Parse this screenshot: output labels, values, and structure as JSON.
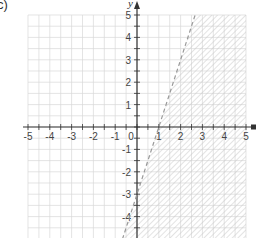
{
  "figure_label": "c)",
  "chart_data": {
    "type": "line",
    "title": "",
    "subtitle": "Graph of linear inequality",
    "xlabel": "x",
    "ylabel": "y",
    "xlim": [
      -5,
      5
    ],
    "ylim": [
      -5,
      5
    ],
    "grid": true,
    "grid_minor_step": 0.5,
    "x_ticks": [
      -5,
      -4,
      -3,
      -2,
      -1,
      0,
      1,
      2,
      3,
      4,
      5
    ],
    "y_ticks": [
      -4,
      -3,
      -2,
      -1,
      1,
      2,
      3,
      4,
      5
    ],
    "x_tick_labels": [
      "-5",
      "-4",
      "-3",
      "-2",
      "-1",
      "0",
      "1",
      "2",
      "3",
      "4",
      "5"
    ],
    "y_tick_labels": [
      "-4",
      "-3",
      "-2",
      "-1",
      "1",
      "2",
      "3",
      "4",
      "5"
    ],
    "series": [
      {
        "name": "boundary line y = 3x - 3",
        "style": "dashed",
        "points": [
          [
            -0.33,
            -4
          ],
          [
            0,
            -3
          ],
          [
            1,
            0
          ],
          [
            2,
            3
          ],
          [
            2.67,
            5
          ]
        ],
        "slope": 3,
        "intercept": -3
      }
    ],
    "shaded_region": {
      "inequality": "y < 3x - 3",
      "side": "right/below the line",
      "pattern": "diagonal hatch"
    },
    "colors": {
      "axis": "#333333",
      "grid": "#d8d8d8",
      "line": "#999999",
      "hatch": "#c8c8c8"
    }
  }
}
